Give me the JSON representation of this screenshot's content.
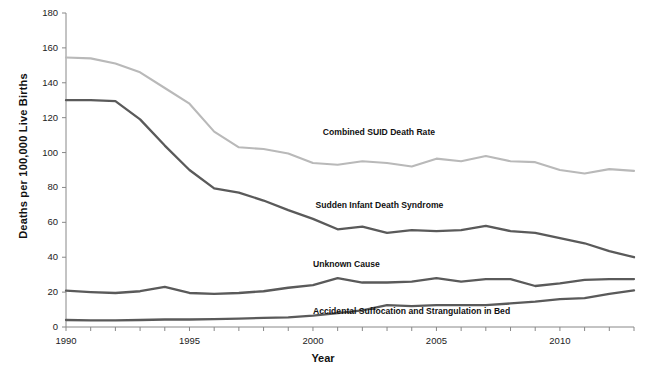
{
  "chart_data": {
    "type": "line",
    "title": "",
    "xlabel": "Year",
    "ylabel": "Deaths per 100,000 Live Births",
    "xlim": [
      1990,
      2013
    ],
    "ylim": [
      0,
      180
    ],
    "ytick_step": 20,
    "yticks": [
      0,
      20,
      40,
      60,
      80,
      100,
      120,
      140,
      160,
      180
    ],
    "xticks_labeled": [
      1990,
      1995,
      2000,
      2005,
      2010
    ],
    "xtick_every": 1,
    "grid": false,
    "legend_position": "inline-labels",
    "x": [
      1990,
      1991,
      1992,
      1993,
      1994,
      1995,
      1996,
      1997,
      1998,
      1999,
      2000,
      2001,
      2002,
      2003,
      2004,
      2005,
      2006,
      2007,
      2008,
      2009,
      2010,
      2011,
      2012,
      2013
    ],
    "series": [
      {
        "name": "Combined SUID Death Rate",
        "color": "#b9b9b9",
        "label_x": 2000.4,
        "label_y": 112,
        "values": [
          154.5,
          154.0,
          151.0,
          146.0,
          137.0,
          128.0,
          112.0,
          103.0,
          102.0,
          99.5,
          94.0,
          93.0,
          95.0,
          94.0,
          92.0,
          96.5,
          95.0,
          98.0,
          95.0,
          94.5,
          90.0,
          88.0,
          90.5,
          89.5
        ]
      },
      {
        "name": "Sudden Infant Death Syndrome",
        "color": "#5a5a5a",
        "label_x": 2000.1,
        "label_y": 70,
        "values": [
          130.0,
          130.0,
          129.5,
          119.0,
          104.0,
          90.0,
          79.5,
          77.0,
          72.5,
          67.0,
          62.0,
          56.0,
          57.5,
          54.0,
          55.5,
          55.0,
          55.5,
          58.0,
          55.0,
          54.0,
          51.0,
          48.0,
          43.5,
          40.0
        ]
      },
      {
        "name": "Unknown Cause",
        "color": "#5a5a5a",
        "label_x": 2000.0,
        "label_y": 36,
        "values": [
          20.8,
          20.0,
          19.5,
          20.5,
          23.0,
          19.5,
          19.0,
          19.5,
          20.5,
          22.5,
          24.0,
          28.0,
          25.5,
          25.5,
          26.0,
          28.0,
          26.0,
          27.5,
          27.5,
          23.5,
          25.0,
          27.0,
          27.5,
          27.5
        ]
      },
      {
        "name": "Accidental Suffocation and Strangulation in Bed",
        "color": "#5a5a5a",
        "label_x": 2000.0,
        "label_y": 9,
        "values": [
          4.0,
          3.8,
          3.8,
          4.0,
          4.3,
          4.3,
          4.5,
          4.8,
          5.2,
          5.5,
          6.5,
          8.0,
          9.5,
          12.5,
          12.0,
          12.5,
          12.5,
          12.5,
          13.5,
          14.5,
          16.0,
          16.5,
          19.0,
          21.0
        ]
      }
    ]
  }
}
